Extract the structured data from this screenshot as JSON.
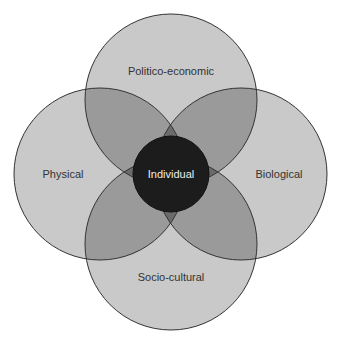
{
  "diagram": {
    "type": "venn-4-around-center",
    "colors": {
      "background": "#ffffff",
      "single": "#c9c9c9",
      "double": "#9a9a9a",
      "triple": "#6b6b6b",
      "center": "#1c1c1c",
      "stroke": "#333333",
      "label": "#333333",
      "center_label": "#eeeeee"
    },
    "circles": [
      {
        "id": "top",
        "label": "Politico-economic",
        "cx": 171,
        "cy": 100,
        "r": 86
      },
      {
        "id": "left",
        "label": "Physical",
        "cx": 100,
        "cy": 174,
        "r": 86
      },
      {
        "id": "right",
        "label": "Biological",
        "cx": 241,
        "cy": 174,
        "r": 86
      },
      {
        "id": "bottom",
        "label": "Socio-cultural",
        "cx": 171,
        "cy": 244,
        "r": 86
      }
    ],
    "center": {
      "label": "Individual",
      "cx": 171,
      "cy": 174,
      "r": 38
    }
  }
}
